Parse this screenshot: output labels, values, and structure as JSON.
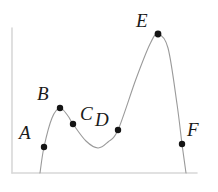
{
  "figure": {
    "title": "",
    "background_color": "#ffffff",
    "curve_color": "#9a9a9a",
    "axis_color": "#d8d8d8",
    "point_color": "#141414",
    "label_color": "#1a1a1a"
  },
  "axes": {
    "y_axis": {
      "x": 12,
      "y_top": 28,
      "y_bottom": 173
    },
    "x_axis": {
      "y": 173,
      "x_left": 12,
      "x_right": 197
    },
    "x_ticks": [],
    "y_ticks": [],
    "xlabel": "",
    "ylabel": "",
    "grid": false
  },
  "chart_data": {
    "type": "line",
    "title": "",
    "xlabel": "",
    "ylabel": "",
    "grid": false,
    "legend": null,
    "xlim": [
      12,
      197
    ],
    "ylim": [
      173,
      28
    ],
    "curve_description": "Smooth continuous curve rising from the x-axis to a small local maximum at B, falling to a local minimum between C and D, rising steeply to a tall global maximum at E, then falling steeply back to the x-axis past F.",
    "curve_path_points": [
      {
        "x": 40,
        "y": 173
      },
      {
        "x": 44,
        "y": 147
      },
      {
        "x": 52,
        "y": 118
      },
      {
        "x": 60,
        "y": 108
      },
      {
        "x": 68,
        "y": 116
      },
      {
        "x": 73,
        "y": 124
      },
      {
        "x": 86,
        "y": 141
      },
      {
        "x": 98,
        "y": 148
      },
      {
        "x": 108,
        "y": 142
      },
      {
        "x": 118,
        "y": 130
      },
      {
        "x": 136,
        "y": 79
      },
      {
        "x": 150,
        "y": 44
      },
      {
        "x": 158,
        "y": 34
      },
      {
        "x": 168,
        "y": 48
      },
      {
        "x": 177,
        "y": 104
      },
      {
        "x": 182,
        "y": 144
      },
      {
        "x": 186,
        "y": 173
      }
    ],
    "labeled_points": [
      {
        "name": "A",
        "x": 44,
        "y": 147,
        "label_x": 19,
        "label_y": 123,
        "radius": 3.2
      },
      {
        "name": "B",
        "x": 60,
        "y": 108,
        "label_x": 37,
        "label_y": 84,
        "radius": 3.2
      },
      {
        "name": "C",
        "x": 73,
        "y": 124,
        "label_x": 80,
        "label_y": 104,
        "radius": 3.2
      },
      {
        "name": "D",
        "x": 118,
        "y": 130,
        "label_x": 95,
        "label_y": 110,
        "radius": 3.2
      },
      {
        "name": "E",
        "x": 158,
        "y": 34,
        "label_x": 136,
        "label_y": 11,
        "radius": 3.4
      },
      {
        "name": "F",
        "x": 182,
        "y": 144,
        "label_x": 187,
        "label_y": 120,
        "radius": 3.2
      }
    ]
  }
}
